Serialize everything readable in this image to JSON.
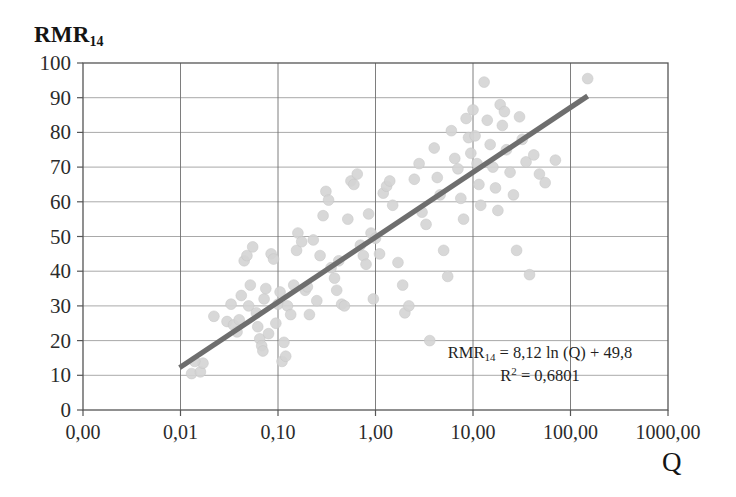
{
  "chart_data": {
    "type": "scatter",
    "title": "RMR14",
    "title_base": "RMR",
    "title_sub": "14",
    "xlabel": "Q",
    "ylabel": "RMR14",
    "xscale": "log",
    "yscale": "linear",
    "xlim": [
      0.001,
      1000
    ],
    "ylim": [
      0,
      100
    ],
    "grid": true,
    "legend": false,
    "x_ticks": [
      "0,00",
      "0,01",
      "0,10",
      "1,00",
      "10,00",
      "100,00",
      "1000,00"
    ],
    "x_tick_values": [
      0.001,
      0.01,
      0.1,
      1,
      10,
      100,
      1000
    ],
    "y_ticks": [
      "0",
      "10",
      "20",
      "30",
      "40",
      "50",
      "60",
      "70",
      "80",
      "90",
      "100"
    ],
    "y_tick_values": [
      0,
      10,
      20,
      30,
      40,
      50,
      60,
      70,
      80,
      90,
      100
    ],
    "point_color": "#d4d4d4",
    "line_color": "#6e6e6e",
    "annotations": [
      "RMR14 = 8,12 ln (Q) + 49,8",
      "R2 = 0,6801"
    ],
    "equation": {
      "lhs_base": "RMR",
      "lhs_sub": "14",
      "rhs": " = 8,12 ln (Q) + 49,8",
      "r2_base": "R",
      "r2_sup": "2",
      "r2_value": " = 0,6801"
    },
    "fit": {
      "slope": 8.12,
      "intercept": 49.8,
      "r_squared": 0.6801,
      "form": "y = 8,12*ln(x) + 49,8",
      "x_start": 0.0098,
      "x_end": 150,
      "y_start": 12.2,
      "y_end": 90.5
    },
    "points": [
      [
        0.013,
        10.5
      ],
      [
        0.016,
        11.0
      ],
      [
        0.017,
        13.5
      ],
      [
        0.014,
        14.0
      ],
      [
        0.022,
        27.0
      ],
      [
        0.03,
        25.5
      ],
      [
        0.033,
        30.5
      ],
      [
        0.035,
        24.5
      ],
      [
        0.038,
        22.5
      ],
      [
        0.04,
        26.0
      ],
      [
        0.042,
        33.0
      ],
      [
        0.045,
        43.0
      ],
      [
        0.048,
        44.5
      ],
      [
        0.05,
        30.0
      ],
      [
        0.052,
        36.0
      ],
      [
        0.055,
        47.0
      ],
      [
        0.06,
        28.0
      ],
      [
        0.062,
        24.0
      ],
      [
        0.065,
        20.5
      ],
      [
        0.068,
        18.5
      ],
      [
        0.07,
        17.0
      ],
      [
        0.072,
        32.0
      ],
      [
        0.075,
        35.0
      ],
      [
        0.08,
        22.0
      ],
      [
        0.085,
        45.0
      ],
      [
        0.09,
        43.5
      ],
      [
        0.095,
        25.0
      ],
      [
        0.1,
        30.5
      ],
      [
        0.105,
        34.0
      ],
      [
        0.11,
        14.0
      ],
      [
        0.115,
        19.5
      ],
      [
        0.12,
        15.5
      ],
      [
        0.125,
        30.0
      ],
      [
        0.135,
        27.5
      ],
      [
        0.145,
        36.0
      ],
      [
        0.155,
        46.0
      ],
      [
        0.16,
        51.0
      ],
      [
        0.175,
        48.5
      ],
      [
        0.19,
        34.5
      ],
      [
        0.2,
        35.5
      ],
      [
        0.21,
        27.5
      ],
      [
        0.23,
        49.0
      ],
      [
        0.25,
        31.5
      ],
      [
        0.27,
        44.5
      ],
      [
        0.29,
        56.0
      ],
      [
        0.31,
        63.0
      ],
      [
        0.33,
        60.5
      ],
      [
        0.35,
        41.0
      ],
      [
        0.38,
        38.0
      ],
      [
        0.4,
        34.5
      ],
      [
        0.42,
        43.0
      ],
      [
        0.45,
        30.5
      ],
      [
        0.48,
        30.0
      ],
      [
        0.52,
        55.0
      ],
      [
        0.56,
        66.0
      ],
      [
        0.6,
        65.0
      ],
      [
        0.65,
        68.0
      ],
      [
        0.7,
        47.5
      ],
      [
        0.75,
        44.5
      ],
      [
        0.8,
        42.0
      ],
      [
        0.85,
        56.5
      ],
      [
        0.9,
        51.0
      ],
      [
        0.95,
        32.0
      ],
      [
        1.0,
        49.5
      ],
      [
        1.1,
        45.0
      ],
      [
        1.2,
        62.5
      ],
      [
        1.3,
        64.5
      ],
      [
        1.4,
        66.0
      ],
      [
        1.5,
        59.0
      ],
      [
        1.7,
        42.5
      ],
      [
        1.9,
        36.0
      ],
      [
        2.0,
        28.0
      ],
      [
        2.2,
        30.0
      ],
      [
        2.5,
        66.5
      ],
      [
        2.8,
        71.0
      ],
      [
        3.0,
        57.0
      ],
      [
        3.3,
        53.5
      ],
      [
        3.6,
        20.0
      ],
      [
        4.0,
        75.5
      ],
      [
        4.3,
        67.0
      ],
      [
        4.6,
        62.0
      ],
      [
        5.0,
        46.0
      ],
      [
        5.5,
        38.5
      ],
      [
        6.0,
        80.5
      ],
      [
        6.5,
        72.5
      ],
      [
        7.0,
        69.5
      ],
      [
        7.5,
        61.0
      ],
      [
        8.0,
        55.0
      ],
      [
        8.5,
        84.0
      ],
      [
        9.0,
        78.5
      ],
      [
        9.5,
        74.0
      ],
      [
        10.0,
        86.5
      ],
      [
        10.5,
        79.0
      ],
      [
        11.0,
        71.0
      ],
      [
        11.5,
        65.0
      ],
      [
        12.0,
        59.0
      ],
      [
        13.0,
        94.5
      ],
      [
        14.0,
        83.5
      ],
      [
        15.0,
        76.5
      ],
      [
        16.0,
        70.0
      ],
      [
        17.0,
        64.0
      ],
      [
        18.0,
        57.5
      ],
      [
        19.0,
        88.0
      ],
      [
        20.0,
        82.0
      ],
      [
        21.0,
        86.0
      ],
      [
        22.0,
        75.0
      ],
      [
        24.0,
        68.5
      ],
      [
        26.0,
        62.0
      ],
      [
        28.0,
        46.0
      ],
      [
        30.0,
        84.5
      ],
      [
        32.0,
        78.0
      ],
      [
        35.0,
        71.5
      ],
      [
        38.0,
        39.0
      ],
      [
        42.0,
        73.5
      ],
      [
        48.0,
        68.0
      ],
      [
        55.0,
        65.5
      ],
      [
        70.0,
        72.0
      ],
      [
        150.0,
        95.5
      ]
    ]
  },
  "axes": {
    "x_axis_label": "Q",
    "y_axis_label_base": "RMR",
    "y_axis_label_sub": "14"
  }
}
